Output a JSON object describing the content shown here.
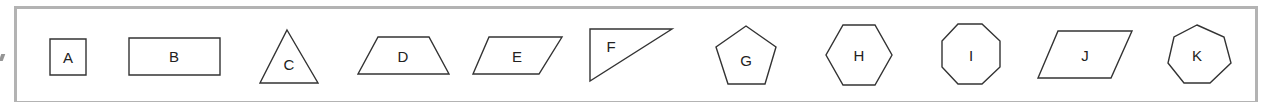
{
  "figure": {
    "frame_color": "#b3b3b3",
    "stroke_color": "#333333",
    "shapes": [
      {
        "label": "A",
        "type": "square",
        "points": "50,39 86,39 86,75 50,75",
        "label_x": 68,
        "label_y": 57
      },
      {
        "label": "B",
        "type": "rectangle",
        "points": "129,38 220,38 220,75 129,75",
        "label_x": 174,
        "label_y": 56
      },
      {
        "label": "C",
        "type": "triangle",
        "points": "287,30 318,83 260,83",
        "label_x": 289,
        "label_y": 64
      },
      {
        "label": "D",
        "type": "trapezoid",
        "points": "378,37 429,37 449,74 358,74",
        "label_x": 403,
        "label_y": 56
      },
      {
        "label": "E",
        "type": "parallelogram",
        "points": "489,37 562,37 539,74 473,74",
        "label_x": 517,
        "label_y": 56
      },
      {
        "label": "F",
        "type": "right-triangle",
        "points": "590,29 672,29 590,81",
        "label_x": 611,
        "label_y": 46
      },
      {
        "label": "G",
        "type": "pentagon",
        "points": "746,26 776,47 765,84 728,84 716,47",
        "label_x": 746,
        "label_y": 60
      },
      {
        "label": "H",
        "type": "hexagon",
        "points": "843,25 875,25 892,55 875,85 843,85 826,55",
        "label_x": 859,
        "label_y": 55
      },
      {
        "label": "I",
        "type": "octagon",
        "points": "958,24 982,24 1000,41 1000,67 982,84 958,84 942,67 942,41",
        "label_x": 971,
        "label_y": 55
      },
      {
        "label": "J",
        "type": "parallelogram",
        "points": "1058,31 1132,31 1111,78 1038,78",
        "label_x": 1085,
        "label_y": 55
      },
      {
        "label": "K",
        "type": "heptagon",
        "points": "1197,25 1224,37 1231,63 1210,83 1184,83 1168,63 1174,37",
        "label_x": 1197,
        "label_y": 55
      }
    ]
  }
}
